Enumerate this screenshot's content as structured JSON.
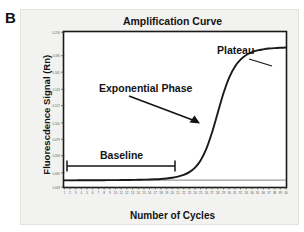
{
  "figure": {
    "panel_letter": "B"
  },
  "chart_data": {
    "type": "line",
    "title": "Amplification Curve",
    "xlabel": "Number of Cycles",
    "ylabel": "Fluorescdence Signal (Rn)",
    "xlim": [
      1,
      40
    ],
    "ylim": [
      0.018,
      0.216
    ],
    "grid": false,
    "legend": null,
    "xticks": [
      "1",
      "2",
      "3",
      "4",
      "5",
      "6",
      "7",
      "8",
      "9",
      "10",
      "11",
      "12",
      "13",
      "14",
      "15",
      "16",
      "17",
      "18",
      "19",
      "20",
      "21",
      "22",
      "23",
      "24",
      "25",
      "26",
      "27",
      "28",
      "29",
      "30",
      "31",
      "32",
      "33",
      "34",
      "35",
      "36",
      "37",
      "38",
      "39",
      "40"
    ],
    "yticks": [
      "0.018",
      "0.036",
      "0.058",
      "0.079",
      "0.100",
      "0.122",
      "0.143",
      "0.165",
      "0.186",
      "0.216"
    ],
    "series": [
      {
        "name": "Amplification curve",
        "color": "#1a1a1a",
        "x": [
          1,
          2,
          3,
          4,
          5,
          6,
          7,
          8,
          9,
          10,
          11,
          12,
          13,
          14,
          15,
          16,
          17,
          18,
          19,
          20,
          21,
          22,
          23,
          24,
          25,
          26,
          27,
          28,
          29,
          30,
          31,
          32,
          33,
          34,
          35,
          36,
          37,
          38,
          39,
          40
        ],
        "values": [
          0.0265,
          0.0265,
          0.0265,
          0.0266,
          0.0266,
          0.0266,
          0.0267,
          0.0267,
          0.0268,
          0.0268,
          0.0269,
          0.027,
          0.0271,
          0.0272,
          0.0274,
          0.0276,
          0.0279,
          0.0283,
          0.0289,
          0.0298,
          0.0312,
          0.0334,
          0.037,
          0.0428,
          0.0523,
          0.0672,
          0.088,
          0.113,
          0.138,
          0.158,
          0.172,
          0.181,
          0.187,
          0.1905,
          0.1928,
          0.1942,
          0.1952,
          0.1958,
          0.1962,
          0.1965
        ]
      },
      {
        "name": "Threshold / no-template reference",
        "color": "#9a9a9a",
        "x": [
          1,
          40
        ],
        "values": [
          0.0268,
          0.0268
        ]
      }
    ],
    "annotations": [
      {
        "name": "plateau",
        "text": "Plateau"
      },
      {
        "name": "exponential-phase",
        "text": "Exponential Phase"
      },
      {
        "name": "baseline",
        "text": "Baseline"
      }
    ]
  }
}
